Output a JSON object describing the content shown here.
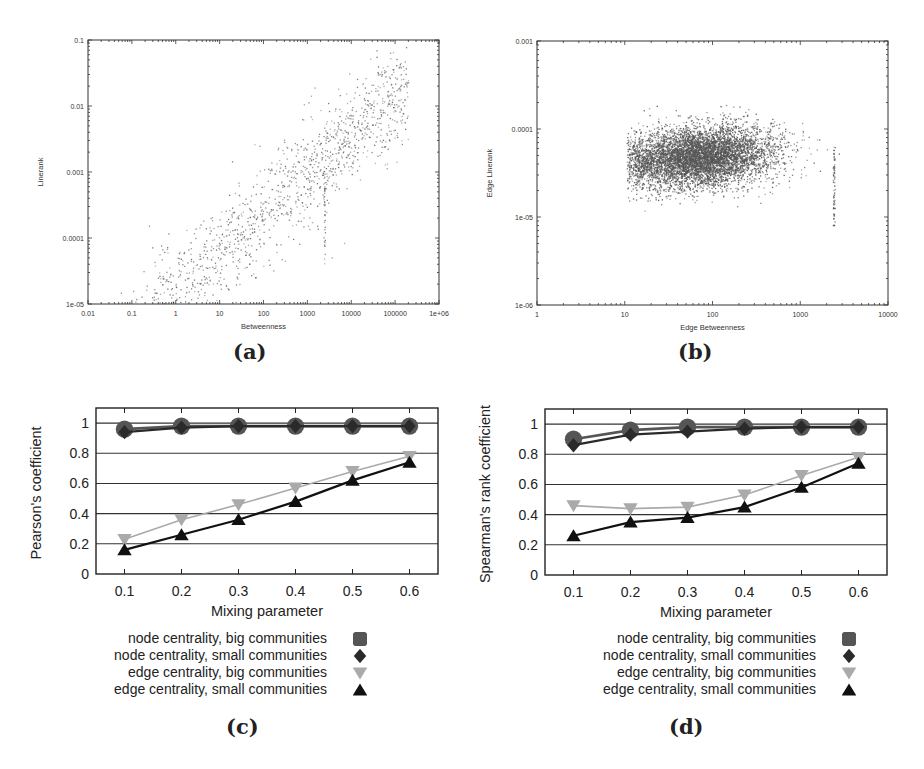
{
  "figure": {
    "captions": {
      "a": "(a)",
      "b": "(b)",
      "c": "(c)",
      "d": "(d)"
    }
  },
  "colors": {
    "node_big": "#555555",
    "node_small": "#2a2a2a",
    "edge_big": "#aaaaaa",
    "edge_small": "#111111",
    "grid": "#333333",
    "scatter_a": "#6a6a6a",
    "scatter_b": "#555555"
  },
  "chart_data": [
    {
      "id": "a",
      "type": "scatter",
      "title": "",
      "xlabel": "Betweenness",
      "ylabel": "Linerank",
      "xscale": "log",
      "yscale": "log",
      "xlim": [
        0.01,
        1000000
      ],
      "ylim": [
        1e-05,
        0.1
      ],
      "xticks": [
        "0.01",
        "0.1",
        "1",
        "10",
        "100",
        "1000",
        "10000",
        "100000",
        "1e+06"
      ],
      "yticks": [
        "1e-05",
        "0.0001",
        "0.001",
        "0.01",
        "0.1"
      ],
      "grid": false,
      "description": "Point cloud along a positive log-log trend from about (0.05, 1e-4) to (2e5, 0.03); densest between Betweenness 10 and 10000, Linerank 1e-4 to 0.01; a vertical streak near Betweenness ~2500.",
      "cloud": {
        "n": 1300,
        "x_log_range": [
          -1.3,
          5.3
        ],
        "slope": 0.58,
        "intercept_log": -3.6,
        "spread_log": 0.38,
        "streak_x_log": 3.38,
        "streak_y_log_range": [
          -4.4,
          -2.9
        ]
      }
    },
    {
      "id": "b",
      "type": "scatter",
      "title": "",
      "xlabel": "Edge Betweenness",
      "ylabel": "Edge Linerank",
      "xscale": "log",
      "yscale": "log",
      "xlim": [
        1,
        10000
      ],
      "ylim": [
        1e-06,
        0.001
      ],
      "xticks": [
        "1",
        "10",
        "100",
        "1000",
        "10000"
      ],
      "yticks": [
        "1e-06",
        "1e-05",
        "0.0001",
        "0.001"
      ],
      "grid": false,
      "description": "Dense horizontal blob of edges with Edge Betweenness from ~10 to ~3000 and Edge Linerank from ~1e-5 to ~1e-4, centered near (60, 5e-5); vertical streak near Edge Betweenness ~2500.",
      "cloud": {
        "n": 6500,
        "x_log_center": 1.85,
        "x_log_spread": 0.42,
        "y_log_center": -4.3,
        "y_log_spread": 0.17,
        "streak_x_log": 3.38,
        "streak_y_log_range": [
          -5.1,
          -4.2
        ]
      }
    },
    {
      "id": "c",
      "type": "line",
      "title": "",
      "xlabel": "Mixing parameter",
      "ylabel": "Pearson's coefficient",
      "x": [
        0.1,
        0.2,
        0.3,
        0.4,
        0.5,
        0.6
      ],
      "xticks": [
        "0.1",
        "0.2",
        "0.3",
        "0.4",
        "0.5",
        "0.6"
      ],
      "yticks": [
        "0",
        "0.2",
        "0.4",
        "0.6",
        "0.8",
        "1"
      ],
      "xlim": [
        0.05,
        0.65
      ],
      "ylim": [
        0,
        1.1
      ],
      "grid": true,
      "legend_position": "below",
      "series": [
        {
          "name": "node centrality, big communities",
          "marker": "circle",
          "values": [
            0.96,
            0.98,
            0.98,
            0.98,
            0.98,
            0.98
          ]
        },
        {
          "name": "node centrality, small communities",
          "marker": "diamond",
          "values": [
            0.94,
            0.97,
            0.98,
            0.98,
            0.98,
            0.98
          ]
        },
        {
          "name": "edge centrality, big communities",
          "marker": "triangle-down",
          "values": [
            0.23,
            0.36,
            0.46,
            0.57,
            0.68,
            0.78
          ]
        },
        {
          "name": "edge centrality, small communities",
          "marker": "triangle-up",
          "values": [
            0.16,
            0.26,
            0.36,
            0.48,
            0.62,
            0.74
          ]
        }
      ]
    },
    {
      "id": "d",
      "type": "line",
      "title": "",
      "xlabel": "Mixing parameter",
      "ylabel": "Spearman's rank coefficient",
      "x": [
        0.1,
        0.2,
        0.3,
        0.4,
        0.5,
        0.6
      ],
      "xticks": [
        "0.1",
        "0.2",
        "0.3",
        "0.4",
        "0.5",
        "0.6"
      ],
      "yticks": [
        "0",
        "0.2",
        "0.4",
        "0.6",
        "0.8",
        "1"
      ],
      "xlim": [
        0.05,
        0.65
      ],
      "ylim": [
        0,
        1.1
      ],
      "grid": true,
      "legend_position": "below",
      "series": [
        {
          "name": "node centrality, big communities",
          "marker": "circle",
          "values": [
            0.9,
            0.96,
            0.98,
            0.98,
            0.98,
            0.98
          ]
        },
        {
          "name": "node centrality, small communities",
          "marker": "diamond",
          "values": [
            0.86,
            0.93,
            0.95,
            0.97,
            0.98,
            0.98
          ]
        },
        {
          "name": "edge centrality, big communities",
          "marker": "triangle-down",
          "values": [
            0.46,
            0.44,
            0.45,
            0.53,
            0.66,
            0.78
          ]
        },
        {
          "name": "edge centrality, small communities",
          "marker": "triangle-up",
          "values": [
            0.26,
            0.35,
            0.38,
            0.45,
            0.58,
            0.74
          ]
        }
      ]
    }
  ]
}
